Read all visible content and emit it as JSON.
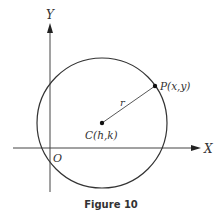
{
  "figure": {
    "caption": "Figure 10",
    "axes": {
      "x_label": "X",
      "y_label": "Y",
      "origin_label": "O"
    },
    "circle": {
      "center_label": "C(h,k)",
      "point_label": "P(x,y)",
      "radius_label": "r"
    },
    "colors": {
      "stroke": "#333333",
      "background": "#ffffff"
    }
  }
}
